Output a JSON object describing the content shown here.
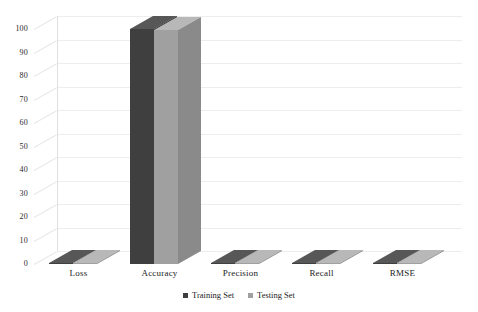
{
  "chart_data": {
    "type": "bar",
    "title": "",
    "subtitle": "",
    "xlabel": "",
    "ylabel": "",
    "categories": [
      "Loss",
      "Accuracy",
      "Precision",
      "Recall",
      "RMSE"
    ],
    "series": [
      {
        "name": "Training Set",
        "color": "#3f3f3f",
        "values": [
          0.3,
          100,
          0.4,
          0.4,
          0.3
        ]
      },
      {
        "name": "Testing Set",
        "color": "#a0a0a0",
        "values": [
          0.3,
          99.5,
          0.4,
          0.4,
          0.3
        ]
      }
    ],
    "ylim": [
      0,
      100
    ],
    "yticks": [
      0,
      10,
      20,
      30,
      40,
      50,
      60,
      70,
      80,
      90,
      100
    ],
    "ytick_labels": [
      "0",
      "10",
      "20",
      "30",
      "40",
      "50",
      "60",
      "70",
      "80",
      "90",
      "100"
    ],
    "grid": true,
    "legend_position": "bottom",
    "three_d": true,
    "annotations": []
  },
  "axis": {
    "y_ticks": [
      {
        "label": "100",
        "value": 100
      },
      {
        "label": "90",
        "value": 90
      },
      {
        "label": "80",
        "value": 80
      },
      {
        "label": "70",
        "value": 70
      },
      {
        "label": "60",
        "value": 60
      },
      {
        "label": "50",
        "value": 50
      },
      {
        "label": "40",
        "value": 40
      },
      {
        "label": "30",
        "value": 30
      },
      {
        "label": "20",
        "value": 20
      },
      {
        "label": "10",
        "value": 10
      },
      {
        "label": "0",
        "value": 0
      }
    ],
    "x_categories": [
      "Loss",
      "Accuracy",
      "Precision",
      "Recall",
      "RMSE"
    ]
  },
  "legend": {
    "items": [
      {
        "label": "Training Set",
        "color": "#3f3f3f"
      },
      {
        "label": "Testing Set",
        "color": "#a0a0a0"
      }
    ]
  },
  "colors": {
    "training_front": "#3f3f3f",
    "training_top": "#575757",
    "training_side": "#2c2c2c",
    "testing_front": "#a0a0a0",
    "testing_top": "#b8b8b8",
    "testing_side": "#8a8a8a",
    "grid": "#ededed",
    "background": "#ffffff"
  }
}
